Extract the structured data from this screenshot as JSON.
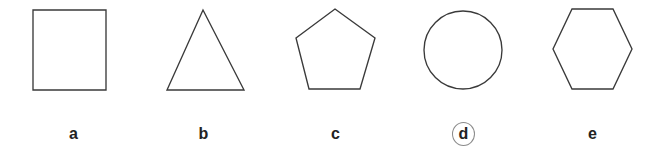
{
  "figure": {
    "kind": "multiple-choice-shape-row",
    "background_color": "#ffffff",
    "stroke_color": "#3a3a3a",
    "label_color": "#232323",
    "answer_ring_color": "#8a8a8a",
    "selected_option": "d",
    "options": [
      {
        "label": "a",
        "shape_name": "square",
        "icon": "square-icon",
        "selected": false,
        "points": "26,10 99,10 99,90 26,90"
      },
      {
        "label": "b",
        "shape_name": "triangle",
        "icon": "triangle-icon",
        "selected": false,
        "points": "66,10 107,90 30,90"
      },
      {
        "label": "c",
        "shape_name": "pentagon",
        "icon": "pentagon-icon",
        "selected": false,
        "points": "66,9 106,38 91,89 40,89 27,38"
      },
      {
        "label": "d",
        "shape_name": "circle",
        "icon": "circle-icon",
        "selected": true,
        "circle": {
          "cx": 66,
          "cy": 50,
          "r": 39
        }
      },
      {
        "label": "e",
        "shape_name": "hexagon",
        "icon": "hexagon-icon",
        "selected": false,
        "points": "46,9 87,9 106,49 87,89 46,89 27,49"
      }
    ]
  }
}
